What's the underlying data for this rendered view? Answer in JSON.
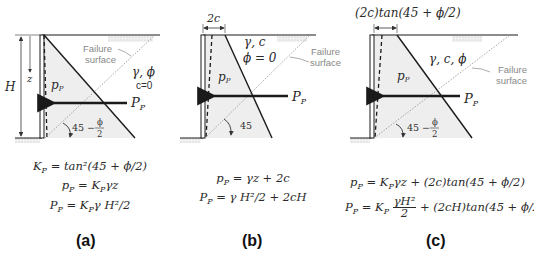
{
  "panels": [
    {
      "id": "a",
      "caption": "(a)",
      "soil_label_1": "γ, ϕ",
      "soil_label_2": "c=0",
      "failure_label_1": "Failure",
      "failure_label_2": "surface",
      "height_label": "H",
      "depth_label": "z",
      "pressure_label": "p",
      "pressure_sub": "P",
      "force_label": "P",
      "force_sub": "P",
      "angle_label": "45 −",
      "angle_frac_num": "ϕ",
      "angle_frac_den": "2",
      "equations": [
        {
          "lhs": "K",
          "lhs_sub": "P",
          "rhs": "= tan²(45 + ϕ/2)"
        },
        {
          "lhs": "p",
          "lhs_sub": "P",
          "rhs": "= K",
          "rhs_sub": "P",
          "rhs2": "γz"
        },
        {
          "lhs": "P",
          "lhs_sub": "P",
          "rhs": "= K",
          "rhs_sub": "P",
          "rhs2": "γ H²/2"
        }
      ]
    },
    {
      "id": "b",
      "caption": "(b)",
      "top_dim_label": "2c",
      "soil_label_1": "γ, c",
      "soil_label_2": "ϕ = 0",
      "failure_label_1": "Failure",
      "failure_label_2": "surface",
      "pressure_label": "p",
      "pressure_sub": "P",
      "force_label": "P",
      "force_sub": "P",
      "angle_label": "45",
      "equations": [
        {
          "lhs": "p",
          "lhs_sub": "P",
          "rhs": "= γz + 2c"
        },
        {
          "lhs": "P",
          "lhs_sub": "P",
          "rhs": "= γ H²/2 + 2cH"
        }
      ]
    },
    {
      "id": "c",
      "caption": "(c)",
      "top_dim_label": "(2c)tan(45 + ϕ/2)",
      "soil_label_1": "γ, c, ϕ",
      "failure_label_1": "Failure",
      "failure_label_2": "surface",
      "pressure_label": "p",
      "pressure_sub": "P",
      "force_label": "P",
      "force_sub": "P",
      "angle_label": "45 −",
      "angle_frac_num": "ϕ",
      "angle_frac_den": "2",
      "equations": [
        {
          "lhs": "p",
          "lhs_sub": "P",
          "rhs": "= K",
          "rhs_sub": "P",
          "rhs2": "γz + (2c)tan(45 + ϕ/2)"
        },
        {
          "lhs": "P",
          "lhs_sub": "P",
          "rhs": "= K",
          "rhs_sub": "P",
          "frac_num": "γH²",
          "frac_den": "2",
          "rhs2": "+ (2cH)tan(45 + ϕ/2)"
        }
      ]
    }
  ],
  "colors": {
    "line": "#1a1a1a",
    "fill": "#eeeeee",
    "dotted": "#9a9a9a",
    "label_gray": "#888888"
  }
}
